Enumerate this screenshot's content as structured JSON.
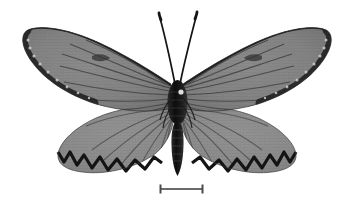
{
  "image": {
    "kind": "museum-specimen-photograph",
    "subject": "butterfly",
    "view": "dorsal, wings spread, pinned specimen",
    "background_color": "#ffffff",
    "rendering": "grayscale",
    "width_px": 354,
    "height_px": 208,
    "alt_text": "Grayscale dorsal photograph of a pinned butterfly specimen with translucent veined wings, dark wing margins and a horizontal scale bar beneath."
  },
  "specimen": {
    "label": "butterfly-specimen",
    "body": {
      "label": "body",
      "head_center": [
        177,
        86
      ],
      "thorax": {
        "top": 82,
        "bottom": 124,
        "half_width": 9
      },
      "abdomen": {
        "top": 120,
        "tip": 176,
        "half_width": 6
      },
      "color": "#1a1a1a",
      "highlight_spot": {
        "cx": 181,
        "cy": 92,
        "r": 2.6,
        "color": "#e8e8e8"
      }
    },
    "antennae": {
      "label": "antennae",
      "count": 2,
      "color": "#151515",
      "left_tip": [
        159,
        14
      ],
      "right_tip": [
        197,
        13
      ],
      "club": "clubbed tips"
    },
    "wings": {
      "forewing_left": {
        "label": "left-forewing",
        "apex": [
          24,
          34
        ],
        "span_note": "extends to far left edge, dark costal margin and apex"
      },
      "forewing_right": {
        "label": "right-forewing",
        "apex": [
          332,
          33
        ],
        "span_note": "mirror of left forewing"
      },
      "hindwing_left": {
        "label": "left-hindwing",
        "outer_margin": "dark zigzag scalloped band"
      },
      "hindwing_right": {
        "label": "right-hindwing",
        "outer_margin": "dark zigzag scalloped band"
      },
      "membrane_color": "#8f8f8f",
      "membrane_color_dark": "#6e6e6e",
      "vein_color": "#3c3c3c",
      "margin_color": "#121212",
      "pale_spot_color": "#dadada",
      "pale_spot_count": 9
    }
  },
  "scale_bar": {
    "label": "scale-bar",
    "caption": "",
    "x_start": 160,
    "x_end": 203,
    "y": 189,
    "length_px": 43,
    "line_color": "#6b6b6b",
    "cap_color": "#4a4a4a",
    "cap_height": 9,
    "line_thickness": 2
  },
  "annotations": {
    "visible_text": []
  }
}
